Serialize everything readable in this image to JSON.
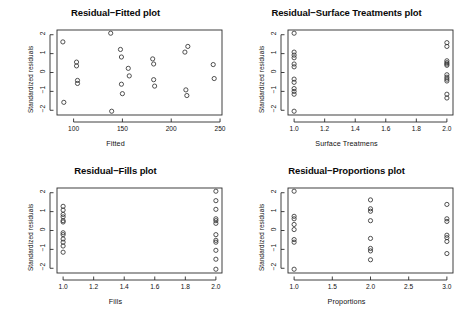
{
  "figure": {
    "background": "#ffffff",
    "foreground": "#111111",
    "point_symbol": "open-circle",
    "layout": "2x2 panel grid of residual diagnostic scatterplots"
  },
  "panels": [
    {
      "id": "residual-fitted",
      "title": "Residual−Fitted plot",
      "xlabel": "Fitted",
      "ylabel": "Standardized residuals"
    },
    {
      "id": "residual-surface-treatments",
      "title": "Residual−Surface Treatments plot",
      "xlabel": "Surface Treatmens",
      "ylabel": "Standardized residuals"
    },
    {
      "id": "residual-fills",
      "title": "Residual−Fills plot",
      "xlabel": "Fills",
      "ylabel": "Standardized residuals"
    },
    {
      "id": "residual-proportions",
      "title": "Residual−Proportions plot",
      "xlabel": "Proportions",
      "ylabel": "Standardized residuals"
    }
  ],
  "chart_data": [
    {
      "type": "scatter",
      "id": "residual-fitted",
      "title": "Residual−Fitted plot",
      "xlabel": "Fitted",
      "ylabel": "Standardized residuals",
      "xlim": [
        83,
        252
      ],
      "ylim": [
        -2.25,
        2.25
      ],
      "xticks": [
        100,
        150,
        200,
        250
      ],
      "yticks": [
        2,
        1,
        0,
        -1,
        -2
      ],
      "grid": false,
      "legend": null,
      "marker": "open-circle",
      "points": [
        {
          "x": 89,
          "y": 1.62
        },
        {
          "x": 90,
          "y": -1.58
        },
        {
          "x": 103,
          "y": 0.55
        },
        {
          "x": 103,
          "y": 0.35
        },
        {
          "x": 104,
          "y": -0.42
        },
        {
          "x": 104,
          "y": -0.58
        },
        {
          "x": 138,
          "y": 2.08
        },
        {
          "x": 139,
          "y": -2.05
        },
        {
          "x": 148,
          "y": 1.22
        },
        {
          "x": 149,
          "y": 0.82
        },
        {
          "x": 149,
          "y": -0.62
        },
        {
          "x": 150,
          "y": -1.12
        },
        {
          "x": 156,
          "y": 0.22
        },
        {
          "x": 157,
          "y": -0.18
        },
        {
          "x": 181,
          "y": 0.72
        },
        {
          "x": 182,
          "y": 0.45
        },
        {
          "x": 182,
          "y": -0.38
        },
        {
          "x": 183,
          "y": -0.72
        },
        {
          "x": 214,
          "y": 1.08
        },
        {
          "x": 215,
          "y": -0.92
        },
        {
          "x": 217,
          "y": 1.38
        },
        {
          "x": 216,
          "y": -1.22
        },
        {
          "x": 243,
          "y": 0.42
        },
        {
          "x": 244,
          "y": -0.32
        }
      ]
    },
    {
      "type": "scatter",
      "id": "residual-surface-treatments",
      "title": "Residual−Surface Treatments plot",
      "xlabel": "Surface Treatmens",
      "ylabel": "Standardized residuals",
      "xlim": [
        0.96,
        2.04
      ],
      "ylim": [
        -2.25,
        2.25
      ],
      "xticks": [
        1.0,
        1.2,
        1.4,
        1.6,
        1.8,
        2.0
      ],
      "yticks": [
        2,
        1,
        0,
        -1,
        -2
      ],
      "grid": false,
      "legend": null,
      "marker": "open-circle",
      "points": [
        {
          "x": 1.0,
          "y": 2.08
        },
        {
          "x": 1.0,
          "y": 1.08
        },
        {
          "x": 1.0,
          "y": 0.92
        },
        {
          "x": 1.0,
          "y": 0.78
        },
        {
          "x": 1.0,
          "y": 0.45
        },
        {
          "x": 1.0,
          "y": 0.3
        },
        {
          "x": 1.0,
          "y": -0.35
        },
        {
          "x": 1.0,
          "y": -0.52
        },
        {
          "x": 1.0,
          "y": -0.85
        },
        {
          "x": 1.0,
          "y": -1.0
        },
        {
          "x": 1.0,
          "y": -1.15
        },
        {
          "x": 1.0,
          "y": -2.05
        },
        {
          "x": 2.0,
          "y": 1.58
        },
        {
          "x": 2.0,
          "y": 1.38
        },
        {
          "x": 2.0,
          "y": 0.62
        },
        {
          "x": 2.0,
          "y": 0.52
        },
        {
          "x": 2.0,
          "y": 0.45
        },
        {
          "x": 2.0,
          "y": 0.38
        },
        {
          "x": 2.0,
          "y": -0.12
        },
        {
          "x": 2.0,
          "y": -0.25
        },
        {
          "x": 2.0,
          "y": -0.35
        },
        {
          "x": 2.0,
          "y": -0.45
        },
        {
          "x": 2.0,
          "y": -1.15
        },
        {
          "x": 2.0,
          "y": -1.35
        }
      ]
    },
    {
      "type": "scatter",
      "id": "residual-fills",
      "title": "Residual−Fills plot",
      "xlabel": "Fills",
      "ylabel": "Standardized residuals",
      "xlim": [
        0.96,
        2.04
      ],
      "ylim": [
        -2.25,
        2.25
      ],
      "xticks": [
        1.0,
        1.2,
        1.4,
        1.6,
        1.8,
        2.0
      ],
      "yticks": [
        2,
        1,
        0,
        -1,
        -2
      ],
      "grid": false,
      "legend": null,
      "marker": "open-circle",
      "points": [
        {
          "x": 1.0,
          "y": 1.28
        },
        {
          "x": 1.0,
          "y": 1.08
        },
        {
          "x": 1.0,
          "y": 0.85
        },
        {
          "x": 1.0,
          "y": 0.72
        },
        {
          "x": 1.0,
          "y": 0.52
        },
        {
          "x": 1.0,
          "y": 0.45
        },
        {
          "x": 1.0,
          "y": -0.12
        },
        {
          "x": 1.0,
          "y": -0.22
        },
        {
          "x": 1.0,
          "y": -0.45
        },
        {
          "x": 1.0,
          "y": -0.62
        },
        {
          "x": 1.0,
          "y": -0.82
        },
        {
          "x": 1.0,
          "y": -1.15
        },
        {
          "x": 2.0,
          "y": 2.08
        },
        {
          "x": 2.0,
          "y": 1.58
        },
        {
          "x": 2.0,
          "y": 1.12
        },
        {
          "x": 2.0,
          "y": 0.62
        },
        {
          "x": 2.0,
          "y": 0.52
        },
        {
          "x": 2.0,
          "y": 0.38
        },
        {
          "x": 2.0,
          "y": -0.22
        },
        {
          "x": 2.0,
          "y": -0.52
        },
        {
          "x": 2.0,
          "y": -0.62
        },
        {
          "x": 2.0,
          "y": -1.05
        },
        {
          "x": 2.0,
          "y": -1.52
        },
        {
          "x": 2.0,
          "y": -2.05
        }
      ]
    },
    {
      "type": "scatter",
      "id": "residual-proportions",
      "title": "Residual−Proportions plot",
      "xlabel": "Proportions",
      "ylabel": "Standardized residuals",
      "xlim": [
        0.92,
        3.08
      ],
      "ylim": [
        -2.25,
        2.25
      ],
      "xticks": [
        1.0,
        1.5,
        2.0,
        2.5,
        3.0
      ],
      "yticks": [
        2,
        1,
        0,
        -1,
        -2
      ],
      "grid": false,
      "legend": null,
      "marker": "open-circle",
      "points": [
        {
          "x": 1.0,
          "y": 2.08
        },
        {
          "x": 1.0,
          "y": 0.75
        },
        {
          "x": 1.0,
          "y": 0.62
        },
        {
          "x": 1.0,
          "y": 0.32
        },
        {
          "x": 1.0,
          "y": 0.05
        },
        {
          "x": 1.0,
          "y": -0.48
        },
        {
          "x": 1.0,
          "y": -0.62
        },
        {
          "x": 1.0,
          "y": -2.05
        },
        {
          "x": 2.0,
          "y": 1.62
        },
        {
          "x": 2.0,
          "y": 1.15
        },
        {
          "x": 2.0,
          "y": 1.02
        },
        {
          "x": 2.0,
          "y": 0.52
        },
        {
          "x": 2.0,
          "y": -0.42
        },
        {
          "x": 2.0,
          "y": -0.95
        },
        {
          "x": 2.0,
          "y": -1.08
        },
        {
          "x": 2.0,
          "y": -1.55
        },
        {
          "x": 3.0,
          "y": 1.38
        },
        {
          "x": 3.0,
          "y": 0.62
        },
        {
          "x": 3.0,
          "y": 0.48
        },
        {
          "x": 3.0,
          "y": -0.25
        },
        {
          "x": 3.0,
          "y": -0.38
        },
        {
          "x": 3.0,
          "y": -0.58
        },
        {
          "x": 3.0,
          "y": -1.22
        }
      ]
    }
  ]
}
